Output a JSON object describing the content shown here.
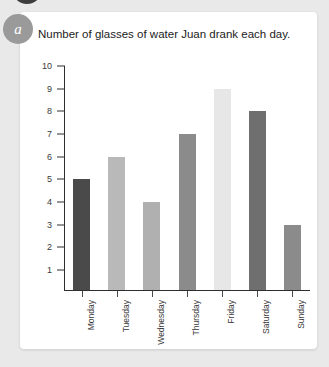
{
  "badge": {
    "label": "a"
  },
  "card": {
    "background": "#ffffff"
  },
  "chart_data": {
    "type": "bar",
    "title": "Number of glasses of water Juan drank each day.",
    "xlabel": "",
    "ylabel": "",
    "ylim": [
      0,
      10
    ],
    "ytick_labels": [
      "10",
      "9",
      "8",
      "7",
      "6",
      "5",
      "4",
      "3",
      "2",
      "1"
    ],
    "yticks": [
      10,
      9,
      8,
      7,
      6,
      5,
      4,
      3,
      2,
      1
    ],
    "grid": false,
    "legend": false,
    "categories": [
      "Monday",
      "Tuesday",
      "Wednesday",
      "Thursday",
      "Friday",
      "Saturday",
      "Sunday"
    ],
    "values": [
      5,
      6,
      4,
      7,
      9,
      8,
      3
    ],
    "bar_colors": [
      "#4a4a4a",
      "#b9b9b9",
      "#b0b0b0",
      "#8b8b8b",
      "#e7e7e7",
      "#6f6f6f",
      "#8b8b8b"
    ],
    "axis_color": "#2e2e2e"
  }
}
